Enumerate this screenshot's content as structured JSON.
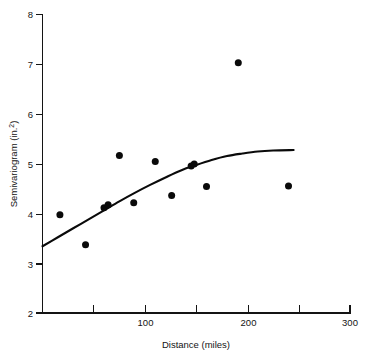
{
  "chart_data": {
    "type": "scatter",
    "title": "",
    "xlabel": "Distance (miles)",
    "ylabel": "Semivariogram (in.²)",
    "ylabel_base": "Semivariogram (in.",
    "ylabel_exponent": "2",
    "ylabel_close": ")",
    "xlim": [
      0,
      300
    ],
    "ylim": [
      2,
      8
    ],
    "grid": false,
    "legend": null,
    "x_ticks": [
      0,
      50,
      100,
      150,
      200,
      250,
      300
    ],
    "x_tick_labels": [
      "",
      "",
      "100",
      "",
      "200",
      "",
      "300"
    ],
    "y_ticks": [
      2,
      3,
      4,
      5,
      6,
      7,
      8
    ],
    "y_tick_labels": [
      "2",
      "3",
      "4",
      "5",
      "6",
      "7",
      "8"
    ],
    "points": [
      {
        "x": 17,
        "y": 3.97
      },
      {
        "x": 42,
        "y": 3.37
      },
      {
        "x": 60,
        "y": 4.11
      },
      {
        "x": 64,
        "y": 4.17
      },
      {
        "x": 75,
        "y": 5.16
      },
      {
        "x": 89,
        "y": 4.21
      },
      {
        "x": 110,
        "y": 5.04
      },
      {
        "x": 126,
        "y": 4.36
      },
      {
        "x": 145,
        "y": 4.95
      },
      {
        "x": 148,
        "y": 4.99
      },
      {
        "x": 160,
        "y": 4.54
      },
      {
        "x": 191,
        "y": 7.02
      },
      {
        "x": 240,
        "y": 4.55
      }
    ],
    "series": [
      {
        "name": "fitted semivariogram model",
        "type": "line",
        "x": [
          0,
          15,
          30,
          45,
          60,
          75,
          90,
          105,
          120,
          135,
          150,
          165,
          180,
          195,
          210,
          225,
          245
        ],
        "y": [
          3.34,
          3.52,
          3.7,
          3.88,
          4.06,
          4.24,
          4.41,
          4.57,
          4.72,
          4.86,
          4.97,
          5.07,
          5.15,
          5.2,
          5.24,
          5.26,
          5.27
        ]
      }
    ],
    "point_color": "#0a0a0a",
    "curve_color": "#0a0a0a",
    "axis_color": "#141414",
    "background": "#ffffff"
  }
}
